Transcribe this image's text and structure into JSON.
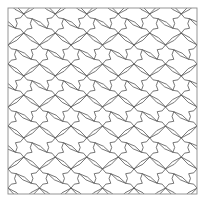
{
  "figure": {
    "kind": "geometric-tiling-diagram",
    "title": "",
    "caption": "",
    "background_color": "#ffffff"
  },
  "canvas": {
    "width": 205,
    "height": 209
  },
  "frame": {
    "name": "border-rectangle",
    "x": 8,
    "y": 8,
    "width": 189,
    "height": 186,
    "stroke_color": "#8a8a8a",
    "stroke_width": 0.9,
    "fill": "none"
  },
  "pattern": {
    "name": "hexagonal-rosette-lattice",
    "description": "Repeating lattice of hexagonal rosettes joined by pinched bowtie connectors",
    "stroke_color": "#4a4a4a",
    "stroke_width": 0.75,
    "fill": "none",
    "tile_width": 31.5,
    "tile_height": 31,
    "columns": 6,
    "rows": 6,
    "origin_x": 8,
    "origin_y": 8,
    "rosette": {
      "sides": 6,
      "radius": 9.6,
      "waist": 4.2
    },
    "connector": {
      "type": "bowtie",
      "length": 10.5,
      "pinch": 1.6
    }
  },
  "colors": {
    "line": "#4a4a4a",
    "frame": "#8a8a8a",
    "paper": "#ffffff"
  }
}
